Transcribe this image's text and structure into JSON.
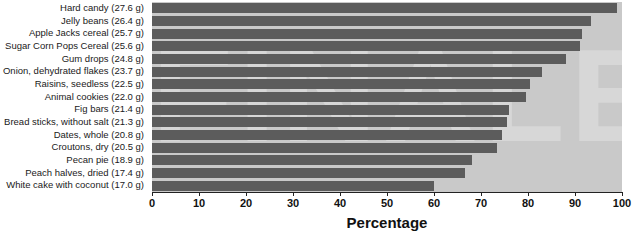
{
  "chart_data": {
    "type": "bar",
    "orientation": "horizontal",
    "title": "",
    "xlabel": "Percentage",
    "ylabel": "",
    "xlim": [
      0,
      100
    ],
    "xticks": [
      0,
      10,
      20,
      30,
      40,
      50,
      60,
      70,
      80,
      90,
      100
    ],
    "grid": false,
    "legend": null,
    "categories": [
      "Hard candy (27.6 g)",
      "Jelly beans (26.4 g)",
      "Apple Jacks cereal (25.7 g)",
      "Sugar Corn Pops Cereal (25.6 g)",
      "Gum drops (24.8 g)",
      "Onion, dehydrated flakes (23.7 g)",
      "Raisins, seedless (22.5 g)",
      "Animal cookies (22.0 g)",
      "Fig bars (21.4 g)",
      "Bread sticks, without salt (21.3 g)",
      "Dates, whole (20.8 g)",
      "Croutons, dry (20.5 g)",
      "Pecan pie (18.9 g)",
      "Peach halves, dried (17.4 g)",
      "White cake with coconut (17.0 g)"
    ],
    "values": [
      99.0,
      93.5,
      91.5,
      91.0,
      88.0,
      83.0,
      80.5,
      79.5,
      76.0,
      75.5,
      74.5,
      73.5,
      68.0,
      66.5,
      60.0
    ],
    "bar_color": "#5c5c5c",
    "plot_background": "#c9c9c9",
    "watermark_text": "FINALE"
  },
  "axis": {
    "tick_labels": [
      "0",
      "10",
      "20",
      "30",
      "40",
      "50",
      "60",
      "70",
      "80",
      "90",
      "100"
    ],
    "x_title": "Percentage"
  }
}
